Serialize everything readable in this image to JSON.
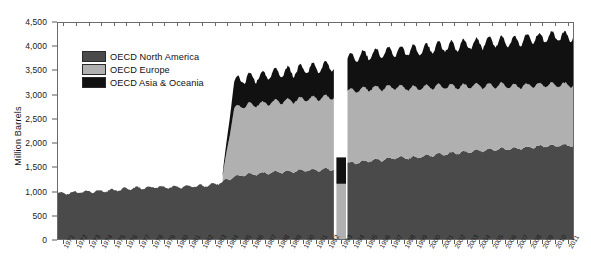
{
  "chart_data": {
    "type": "area",
    "title": "",
    "subtitle": "",
    "xlabel": "",
    "ylabel": "Million Barrels",
    "stacked": true,
    "grid": false,
    "legend_position": "inside-top-left",
    "ylim": [
      0,
      4500
    ],
    "ytick_labels": [
      "0",
      "500",
      "1,000",
      "1,500",
      "2,000",
      "2,500",
      "3,000",
      "3,500",
      "4,000",
      "4,500"
    ],
    "ytick_values": [
      0,
      500,
      1000,
      1500,
      2000,
      2500,
      3000,
      3500,
      4000,
      4500
    ],
    "categories": [
      "1971",
      "1972",
      "1973",
      "1974",
      "1975",
      "1976",
      "1977",
      "1978",
      "1979",
      "1980",
      "1981",
      "1982",
      "1983",
      "1984",
      "1985",
      "1986",
      "1987",
      "1988",
      "1989",
      "1990",
      "1991",
      "1992",
      "1993",
      "1994",
      "1995",
      "1996",
      "1997",
      "1998",
      "1999",
      "2000",
      "2001",
      "2002",
      "2003",
      "2004",
      "2005",
      "2006",
      "2007",
      "2008",
      "2009",
      "2010",
      "2011"
    ],
    "colors": {
      "OECD North America": "#4a4a4a",
      "OECD Europe": "#b0b0b0",
      "OECD Asia & Oceania": "#111111"
    },
    "anomaly": {
      "year": "1993",
      "north_america": 0,
      "europe": 1150,
      "asia_oceania": 550,
      "total": 1700
    },
    "series": [
      {
        "name": "OECD North America",
        "values": [
          950,
          960,
          985,
          995,
          1005,
          1030,
          1060,
          1070,
          1085,
          1075,
          1090,
          1100,
          1120,
          1180,
          1300,
          1340,
          1360,
          1390,
          1400,
          1420,
          1430,
          1450,
          1500,
          1580,
          1600,
          1640,
          1660,
          1700,
          1690,
          1720,
          1760,
          1780,
          1800,
          1830,
          1850,
          1870,
          1880,
          1900,
          1930,
          1940,
          1950
        ]
      },
      {
        "name": "OECD Europe",
        "values": [
          0,
          0,
          0,
          0,
          0,
          0,
          0,
          0,
          0,
          0,
          0,
          0,
          0,
          0,
          1430,
          1440,
          1450,
          1460,
          1470,
          1480,
          1490,
          1500,
          1150,
          1500,
          1510,
          1500,
          1490,
          1470,
          1450,
          1440,
          1420,
          1400,
          1380,
          1360,
          1340,
          1330,
          1310,
          1290,
          1280,
          1270,
          1260
        ]
      },
      {
        "name": "OECD Asia & Oceania",
        "values": [
          0,
          0,
          0,
          0,
          0,
          0,
          0,
          0,
          0,
          0,
          0,
          0,
          0,
          0,
          560,
          570,
          580,
          590,
          600,
          620,
          640,
          660,
          550,
          690,
          700,
          720,
          740,
          760,
          780,
          800,
          820,
          840,
          860,
          880,
          900,
          920,
          940,
          960,
          980,
          1000,
          1010
        ]
      }
    ]
  },
  "legend": {
    "items": [
      {
        "label": "OECD North America",
        "color": "#4a4a4a"
      },
      {
        "label": "OECD Europe",
        "color": "#b0b0b0"
      },
      {
        "label": "OECD Asia & Oceania",
        "color": "#111111"
      }
    ]
  }
}
